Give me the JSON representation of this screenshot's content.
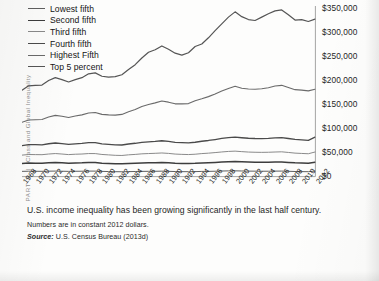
{
  "running_head": {
    "part": "PART 3",
    "separator": "|",
    "title": "Class and Global Inequality"
  },
  "caption": {
    "main": "U.S. income inequality has been growing significantly in the last half century.",
    "note": "Numbers are in constant 2012 dollars.",
    "source_word": "Source:",
    "source_text": " U.S. Census Bureau (2013d)"
  },
  "chart_data": {
    "type": "line",
    "title": "",
    "xlabel": "",
    "ylabel": "",
    "grid": false,
    "legend_position": "top-left",
    "ylim": [
      0,
      350000
    ],
    "xlim": [
      1968,
      2012
    ],
    "ytick_labels": [
      "$350,000",
      "$300,000",
      "$250,000",
      "$200,000",
      "$150,000",
      "$100,000",
      "$50,000",
      "$0"
    ],
    "ytick_values": [
      350000,
      300000,
      250000,
      200000,
      150000,
      100000,
      50000,
      0
    ],
    "xtick_labels": [
      "1968",
      "1970",
      "1972",
      "1974",
      "1976",
      "1978",
      "1980",
      "1982",
      "1984",
      "1986",
      "1988",
      "1990",
      "1992",
      "1994",
      "1996",
      "1998",
      "2000",
      "2002",
      "2004",
      "2006",
      "2008",
      "2010",
      "2012"
    ],
    "x": [
      1968,
      1969,
      1970,
      1971,
      1972,
      1973,
      1974,
      1975,
      1976,
      1977,
      1978,
      1979,
      1980,
      1981,
      1982,
      1983,
      1984,
      1985,
      1986,
      1987,
      1988,
      1989,
      1990,
      1991,
      1992,
      1993,
      1994,
      1995,
      1996,
      1997,
      1998,
      1999,
      2000,
      2001,
      2002,
      2003,
      2004,
      2005,
      2006,
      2007,
      2008,
      2009,
      2010,
      2011,
      2012
    ],
    "series": [
      {
        "name": "Lowest fifth",
        "color": "#5f5f5f",
        "width": 1.0,
        "values": [
          10900,
          11200,
          11100,
          11000,
          11300,
          11500,
          11200,
          10900,
          11100,
          11200,
          11500,
          11400,
          10900,
          10500,
          10200,
          10100,
          10400,
          10600,
          10900,
          11000,
          11100,
          11300,
          11000,
          10500,
          10300,
          10200,
          10400,
          10800,
          10900,
          11200,
          11600,
          11900,
          12000,
          11700,
          11400,
          11300,
          11200,
          11200,
          11400,
          11500,
          11100,
          10600,
          10400,
          10200,
          11490
        ]
      },
      {
        "name": "Second fifth",
        "color": "#3d3d3d",
        "width": 1.5,
        "values": [
          27500,
          28200,
          28000,
          27900,
          28600,
          29200,
          28700,
          27900,
          28400,
          28600,
          29200,
          29100,
          28000,
          27300,
          26700,
          26500,
          27200,
          27700,
          28400,
          28700,
          29000,
          29400,
          28800,
          27900,
          27500,
          27300,
          27700,
          28400,
          28900,
          29600,
          30400,
          31000,
          31300,
          30700,
          30200,
          29900,
          29800,
          29900,
          30200,
          30400,
          29600,
          28700,
          28300,
          27900,
          29900
        ]
      },
      {
        "name": "Third fifth",
        "color": "#8a8a8a",
        "width": 1.0,
        "values": [
          44700,
          46000,
          45800,
          45600,
          47000,
          48000,
          47000,
          45800,
          46600,
          47000,
          48000,
          47900,
          46100,
          45200,
          44300,
          44000,
          45300,
          46200,
          47400,
          48000,
          48500,
          49200,
          48300,
          46900,
          46300,
          45900,
          46600,
          47900,
          48800,
          50000,
          51300,
          52400,
          53000,
          52000,
          51100,
          50700,
          50500,
          50700,
          51200,
          51600,
          50300,
          48900,
          48200,
          47600,
          51180
        ]
      },
      {
        "name": "Fourth fifth",
        "color": "#4a4a4a",
        "width": 1.3,
        "values": [
          64500,
          66600,
          66400,
          66200,
          68400,
          70000,
          68600,
          67000,
          68300,
          69000,
          70600,
          70600,
          68200,
          67000,
          66000,
          65800,
          67900,
          69400,
          71400,
          72500,
          73400,
          74600,
          73400,
          71400,
          70700,
          70300,
          71500,
          73600,
          75200,
          77200,
          79400,
          81200,
          82300,
          80900,
          79800,
          79300,
          79200,
          79600,
          80500,
          81300,
          79300,
          77300,
          76300,
          75500,
          82100
        ]
      },
      {
        "name": "Highest Fifth",
        "color": "#6a6a6a",
        "width": 1.1,
        "values": [
          113000,
          118000,
          118500,
          118900,
          124000,
          127500,
          125500,
          123000,
          126000,
          128500,
          132500,
          133500,
          129500,
          128500,
          128000,
          129500,
          135000,
          139500,
          146000,
          150000,
          153500,
          157500,
          155000,
          151500,
          151500,
          152000,
          158000,
          162000,
          166500,
          172000,
          178000,
          183500,
          188000,
          184000,
          182500,
          182000,
          183000,
          185000,
          188500,
          190000,
          185500,
          181000,
          180000,
          178500,
          181900
        ]
      },
      {
        "name": "Top 5 percent",
        "color": "#555555",
        "width": 1.2,
        "values": [
          180000,
          189000,
          190000,
          190500,
          200000,
          206000,
          202000,
          197000,
          202000,
          206000,
          214000,
          216000,
          209000,
          207000,
          208000,
          212000,
          223000,
          233000,
          247000,
          259000,
          264000,
          272000,
          265000,
          257000,
          253000,
          258000,
          271000,
          276000,
          289000,
          304000,
          318000,
          332000,
          343000,
          333000,
          327000,
          325000,
          332000,
          339000,
          345000,
          347000,
          337000,
          326000,
          327000,
          323000,
          328000
        ]
      }
    ]
  }
}
